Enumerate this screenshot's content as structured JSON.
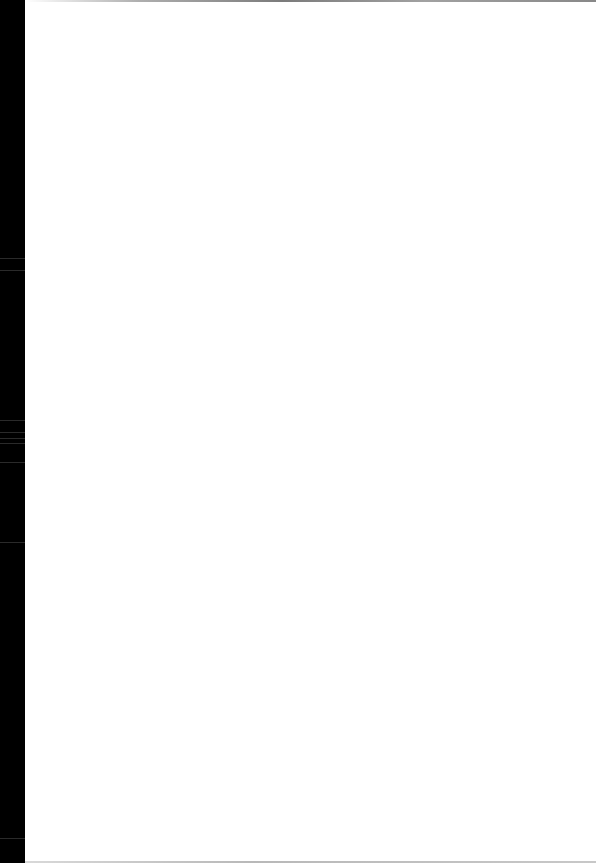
{
  "document": {
    "type": "scanned-page",
    "content": "",
    "colors": {
      "page": "#ffffff",
      "scan_border": "#000000",
      "edge_shadow": "#8a8a8a"
    }
  }
}
